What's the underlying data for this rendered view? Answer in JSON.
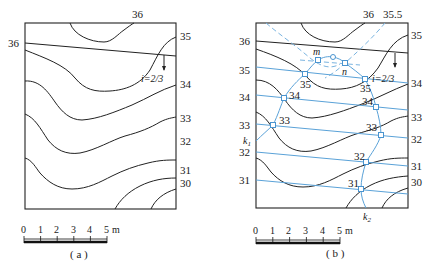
{
  "figure": {
    "panels": [
      {
        "id": "a",
        "caption": "( a )",
        "contour_labels_right": [
          "35",
          "34",
          "33",
          "32",
          "31",
          "30"
        ],
        "contour_label_top": "36",
        "contour_label_left": "36",
        "slope_label": "i=2/3",
        "scale": {
          "ticks": [
            "0",
            "1",
            "2",
            "3",
            "4",
            "5"
          ],
          "unit": "m"
        }
      },
      {
        "id": "b",
        "caption": "( b )",
        "contour_labels_right": [
          "35",
          "34",
          "33",
          "32",
          "31",
          "30"
        ],
        "contour_labels_top": [
          "36",
          "35.5"
        ],
        "contour_labels_left": [
          "36",
          "35",
          "34",
          "33",
          "32",
          "31"
        ],
        "k1_label": "k",
        "k1_sub": "1",
        "k2_label": "k",
        "k2_sub": "2",
        "slope_label": "i=2/3",
        "point_labels": {
          "m": "m",
          "n": "n",
          "p35_left": "35",
          "p35_right": "35",
          "p34_left": "34",
          "p34_right": "34",
          "p33_left": "33",
          "p33_right": "33",
          "p32": "32",
          "p31": "31"
        },
        "scale": {
          "ticks": [
            "0",
            "1",
            "2",
            "3",
            "4",
            "5"
          ],
          "unit": "m"
        }
      }
    ],
    "colors": {
      "contour": "#222222",
      "design_line": "#5aa2d8",
      "point_marker": "#4a94cf"
    }
  }
}
